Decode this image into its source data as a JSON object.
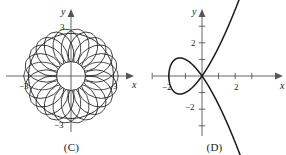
{
  "figure": {
    "panels": [
      {
        "id": "C",
        "caption": "(C)",
        "axes": {
          "x_label": "x",
          "y_label": "y",
          "x_ticks": [
            {
              "value": -3,
              "label": "−3"
            },
            {
              "value": 3,
              "label": "3"
            }
          ],
          "y_ticks": [
            {
              "value": 3,
              "label": "3"
            },
            {
              "value": -3,
              "label": "−3"
            }
          ]
        },
        "chart_data": {
          "type": "line",
          "title": "",
          "curve_name": "epitrochoid-rose",
          "xlabel": "x",
          "ylabel": "y",
          "xlim": [
            -3.8,
            3.8
          ],
          "ylim": [
            -3.8,
            3.8
          ],
          "grid": false,
          "legend": "none",
          "petals": 22,
          "outer_radius": 3,
          "inner_radius": 1.05,
          "description": "Many overlapping circular petals forming a rosette ring around an empty circular center at the origin; outer extent reaches x = ±3 and y = ±3."
        }
      },
      {
        "id": "D",
        "caption": "(D)",
        "axes": {
          "x_label": "x",
          "y_label": "y",
          "x_ticks": [
            {
              "value": -3,
              "label": ""
            },
            {
              "value": -2,
              "label": "−2"
            },
            {
              "value": -1,
              "label": ""
            },
            {
              "value": 1,
              "label": ""
            },
            {
              "value": 2,
              "label": "2"
            },
            {
              "value": 3,
              "label": ""
            }
          ],
          "y_ticks": [
            {
              "value": 3,
              "label": ""
            },
            {
              "value": 2,
              "label": "2"
            },
            {
              "value": 1,
              "label": ""
            },
            {
              "value": -1,
              "label": ""
            },
            {
              "value": -2,
              "label": "−2"
            },
            {
              "value": -3,
              "label": ""
            }
          ]
        },
        "chart_data": {
          "type": "line",
          "title": "",
          "curve_name": "looped-cubic",
          "xlabel": "x",
          "ylabel": "y",
          "xlim": [
            -3.2,
            4.8
          ],
          "ylim": [
            -4.2,
            4.2
          ],
          "grid": false,
          "legend": "none",
          "loop_left_x": -2,
          "node_x": 0,
          "description": "Cubic curve y² = x²(x + 2) with a closed loop between x = −2 and the origin, and two branches leaving the origin toward upper right and lower right."
        }
      }
    ]
  }
}
